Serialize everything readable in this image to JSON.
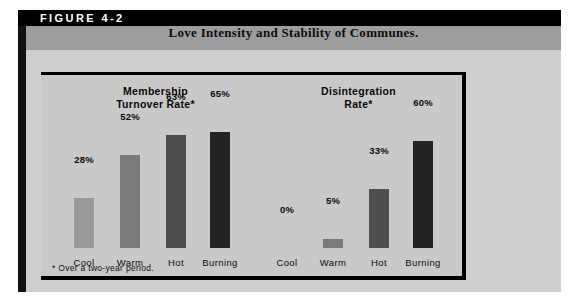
{
  "figure": {
    "label": "FIGURE 4-2",
    "title": "Love Intensity and Stability of Communes.",
    "footnote": "* Over a two-year period."
  },
  "colors": {
    "label_bar": "#000000",
    "title_band": "#9d9d9d",
    "body_band": "#cfcfcf",
    "panel": "#c9c9c9",
    "panel_border": "#000000",
    "bar_cool": "#9a9a9a",
    "bar_warm": "#7b7b7b",
    "bar_hot": "#4e4e4e",
    "bar_burning": "#232323",
    "text": "#0c0c0c"
  },
  "chart_data": {
    "type": "bar",
    "title": "Love Intensity and Stability of Communes.",
    "xlabel": "",
    "ylabel": "",
    "ylim": [
      0,
      70
    ],
    "grid": false,
    "legend": "none",
    "annotations": [
      "* Over a two-year period."
    ],
    "categories": [
      "Cool",
      "Warm",
      "Hot",
      "Burning"
    ],
    "panels": [
      {
        "title_lines": [
          "Membership",
          "Turnover Rate*"
        ],
        "title": "Membership Turnover Rate*",
        "values": [
          28,
          52,
          63,
          65
        ],
        "labels": [
          "28%",
          "52%",
          "63%",
          "65%"
        ]
      },
      {
        "title_lines": [
          "Disintegration",
          "Rate*"
        ],
        "title": "Disintegration Rate*",
        "values": [
          0,
          5,
          33,
          60
        ],
        "labels": [
          "0%",
          "5%",
          "33%",
          "60%"
        ]
      }
    ]
  }
}
